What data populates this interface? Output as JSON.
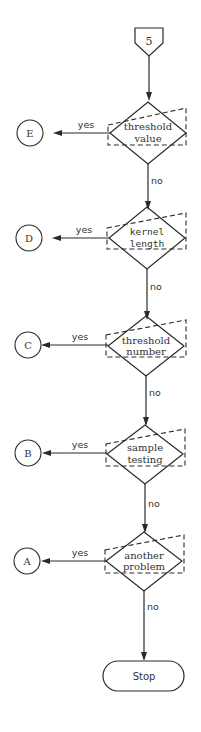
{
  "diagram": {
    "type": "flowchart",
    "entry_connector": {
      "label": "5",
      "shape": "off-page-pentagon"
    },
    "decisions": [
      {
        "id": "threshold-value",
        "lines": [
          "threshold",
          "value"
        ],
        "yes_label": "yes",
        "no_label": "no",
        "yes_target": "E"
      },
      {
        "id": "kernel-length",
        "lines": [
          "kernel",
          "length"
        ],
        "yes_label": "yes",
        "no_label": "no",
        "yes_target": "D"
      },
      {
        "id": "threshold-number",
        "lines": [
          "threshold",
          "number"
        ],
        "yes_label": "yes",
        "no_label": "no",
        "yes_target": "C"
      },
      {
        "id": "sample-testing",
        "lines": [
          "sample",
          "testing"
        ],
        "yes_label": "yes",
        "no_label": "no",
        "yes_target": "B"
      },
      {
        "id": "another-problem",
        "lines": [
          "another",
          "problem"
        ],
        "yes_label": "yes",
        "no_label": "no",
        "yes_target": "A"
      }
    ],
    "connectors": [
      "E",
      "D",
      "C",
      "B",
      "A"
    ],
    "terminal": {
      "label": "Stop"
    },
    "colors": {
      "stroke": "#2a2a2a",
      "text": "#333333",
      "background": "#ffffff"
    }
  }
}
